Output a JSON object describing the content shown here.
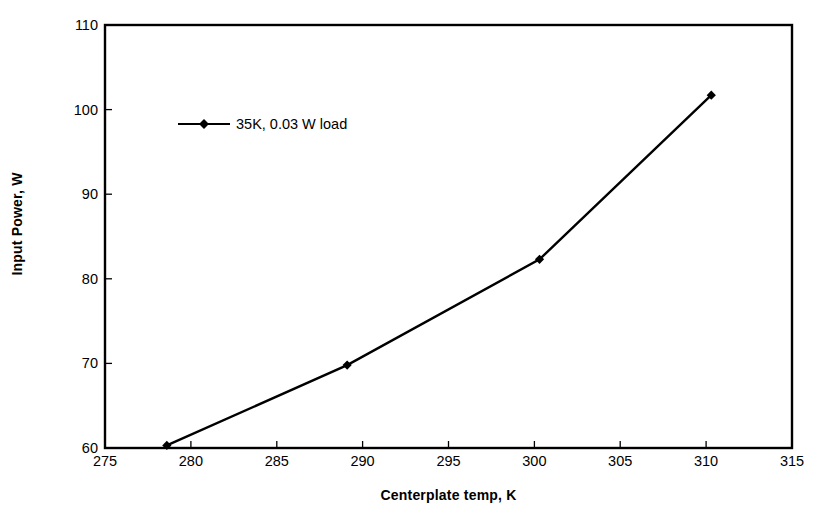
{
  "chart_data": {
    "type": "line",
    "title": "",
    "xlabel": "Centerplate temp, K",
    "ylabel": "Input Power, W",
    "xlim": [
      275,
      315
    ],
    "ylim": [
      60,
      110
    ],
    "xticks": [
      275,
      280,
      285,
      290,
      295,
      300,
      305,
      310,
      315
    ],
    "yticks": [
      60,
      70,
      80,
      90,
      100,
      110
    ],
    "grid": false,
    "legend_position": "inside-upper-left",
    "series": [
      {
        "name": "35K, 0.03 W load",
        "marker": "diamond",
        "color": "#000000",
        "x": [
          278.6,
          289.1,
          300.3,
          310.3
        ],
        "y": [
          60.3,
          69.8,
          82.3,
          101.7
        ]
      }
    ]
  },
  "axes": {
    "y_title": "Input Power, W",
    "x_title": "Centerplate temp, K",
    "y_tick_labels": [
      "110",
      "100",
      "90",
      "80",
      "70",
      "60"
    ],
    "x_tick_labels": [
      "275",
      "280",
      "285",
      "290",
      "295",
      "300",
      "305",
      "310",
      "315"
    ]
  },
  "legend": {
    "entries": [
      {
        "label": "35K, 0.03 W load"
      }
    ]
  },
  "colors": {
    "series": "#000000",
    "axis": "#000000",
    "background": "#ffffff"
  }
}
